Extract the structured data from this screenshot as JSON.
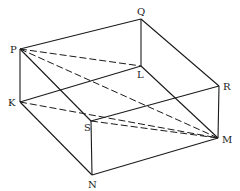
{
  "figure": {
    "type": "box (rectangular prism) with diagonals",
    "stroke_color": "#1a1a1a",
    "background": "#ffffff",
    "vertices": {
      "P": [
        20,
        49
      ],
      "Q": [
        141,
        19
      ],
      "R": [
        219,
        86
      ],
      "L": [
        141,
        66
      ],
      "K": [
        20,
        102
      ],
      "S": [
        91,
        121
      ],
      "N": [
        92,
        175
      ],
      "M": [
        218,
        138
      ]
    },
    "solid_edges": [
      [
        "P",
        "Q"
      ],
      [
        "Q",
        "R"
      ],
      [
        "R",
        "M"
      ],
      [
        "Q",
        "L"
      ],
      [
        "P",
        "K"
      ],
      [
        "K",
        "N"
      ],
      [
        "N",
        "M"
      ],
      [
        "S",
        "R"
      ],
      [
        "S",
        "N"
      ],
      [
        "P",
        "S"
      ],
      [
        "K",
        "L"
      ],
      [
        "L",
        "M"
      ]
    ],
    "dashed_edges": [
      [
        "P",
        "L"
      ],
      [
        "P",
        "M"
      ],
      [
        "K",
        "M"
      ],
      [
        "S",
        "M"
      ]
    ],
    "labels": [
      {
        "text": "P",
        "x": 10,
        "y": 45
      },
      {
        "text": "Q",
        "x": 137,
        "y": 7
      },
      {
        "text": "R",
        "x": 223,
        "y": 82
      },
      {
        "text": "L",
        "x": 137,
        "y": 70
      },
      {
        "text": "K",
        "x": 8,
        "y": 98
      },
      {
        "text": "S",
        "x": 84,
        "y": 123
      },
      {
        "text": "N",
        "x": 88,
        "y": 180
      },
      {
        "text": "M",
        "x": 222,
        "y": 135
      }
    ]
  }
}
